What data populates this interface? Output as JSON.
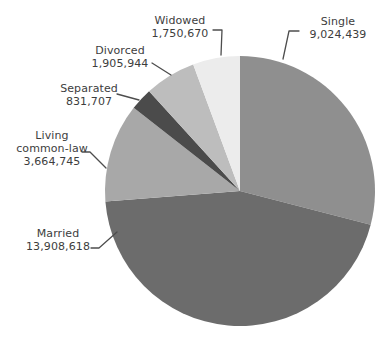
{
  "chart_data": {
    "type": "pie",
    "title": "",
    "legend": "none",
    "label_style": "outside-with-leader-lines",
    "start_angle_deg": 0,
    "direction": "clockwise",
    "background_color": "#ffffff",
    "label_text_color": "#3d3d3d",
    "leader_line_color": "#4d4d4d",
    "slices": [
      {
        "label": "Single",
        "value": 9024439,
        "value_label": "9,024,439",
        "color": "#8f8f8f"
      },
      {
        "label": "Married",
        "value": 13908618,
        "value_label": "13,908,618",
        "color": "#6c6c6c"
      },
      {
        "label": "Living common-law",
        "value": 3664745,
        "value_label": "3,664,745",
        "color": "#a8a8a8"
      },
      {
        "label": "Separated",
        "value": 831707,
        "value_label": "831,707",
        "color": "#4b4b4b"
      },
      {
        "label": "Divorced",
        "value": 1905944,
        "value_label": "1,905,944",
        "color": "#bdbdbd"
      },
      {
        "label": "Widowed",
        "value": 1750670,
        "value_label": "1,750,670",
        "color": "#ececec"
      }
    ]
  }
}
